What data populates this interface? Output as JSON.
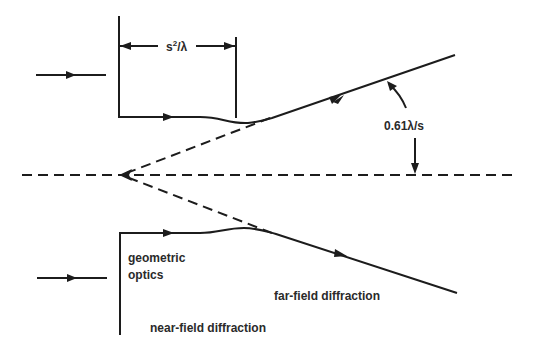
{
  "diagram": {
    "labels": {
      "distance": "s²/λ",
      "distance_base": "s",
      "distance_sup": "2",
      "distance_tail": "/λ",
      "angle": "0.61λ/s",
      "geometric_line1": "geometric",
      "geometric_line2": "optics",
      "far_field": "far-field diffraction",
      "near_field": "near-field diffraction"
    },
    "colors": {
      "line": "#1c1c1c",
      "text": "#2a2a2a",
      "background": "#ffffff"
    }
  }
}
